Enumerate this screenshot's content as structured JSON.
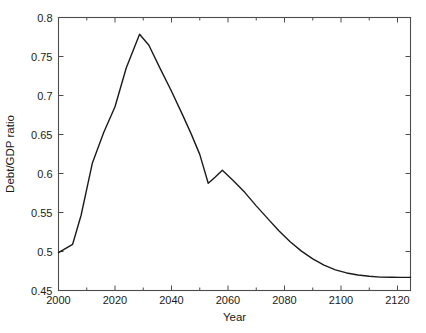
{
  "figure": {
    "background": "#ffffff",
    "axes_color": "#4d4d4d",
    "line_color": "#1a1a1a"
  },
  "chart_data": {
    "type": "line",
    "title": "",
    "xlabel": "Year",
    "ylabel": "Debt/GDP ratio",
    "xlim": [
      2000,
      2124.6
    ],
    "ylim": [
      0.45,
      0.8
    ],
    "xticks": [
      2000,
      2020,
      2040,
      2060,
      2080,
      2100,
      2120
    ],
    "xticklabels": [
      "2000",
      "2020",
      "2040",
      "2060",
      "2080",
      "2100",
      "2120"
    ],
    "yticks": [
      0.45,
      0.5,
      0.55,
      0.6,
      0.65,
      0.7,
      0.75,
      0.8
    ],
    "yticklabels": [
      "0.45",
      "0.5",
      "0.55",
      "0.6",
      "0.65",
      "0.7",
      "0.75",
      "0.8"
    ],
    "grid": false,
    "legend": null,
    "tick_direction": "in",
    "box": true,
    "series": [
      {
        "name": "Debt/GDP ratio",
        "color": "#1a1a1a",
        "linewidth": 1.4,
        "x": [
          2000,
          2005,
          2008,
          2012,
          2016,
          2020,
          2024,
          2028.7,
          2032,
          2036,
          2040,
          2044,
          2047,
          2050,
          2053,
          2055.5,
          2058,
          2062,
          2066,
          2070,
          2074,
          2078,
          2082,
          2086,
          2090,
          2094,
          2098,
          2102,
          2106,
          2110,
          2114,
          2118,
          2121,
          2124.6
        ],
        "y": [
          0.4985,
          0.5092,
          0.5465,
          0.6135,
          0.6525,
          0.6855,
          0.7355,
          0.7785,
          0.7645,
          0.7345,
          0.7055,
          0.6745,
          0.6505,
          0.6245,
          0.5875,
          0.5955,
          0.6042,
          0.5905,
          0.5755,
          0.5585,
          0.5425,
          0.5265,
          0.5125,
          0.5005,
          0.4905,
          0.4825,
          0.4765,
          0.4725,
          0.4698,
          0.4682,
          0.4672,
          0.4669,
          0.4668,
          0.4668
        ]
      }
    ]
  }
}
